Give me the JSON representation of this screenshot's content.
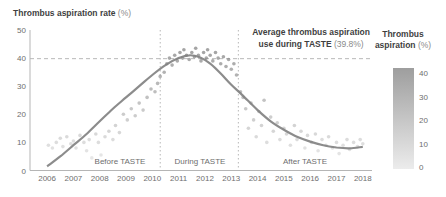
{
  "title": {
    "main": "Thrombus aspiration rate",
    "unit": " (%)"
  },
  "annotation": {
    "line1": "Average thrombus aspiration",
    "line2_bold": "use during TASTE",
    "line2_value": " (39.8%)"
  },
  "phases": {
    "before": "Before TASTE",
    "during": "During TASTE",
    "after": "After TASTE"
  },
  "legend": {
    "title_line1": "Thrombus",
    "title_line2": "aspiration",
    "unit": " (%)",
    "ticks": [
      "40",
      "30",
      "20",
      "10",
      "0"
    ]
  },
  "colors": {
    "axis": "#b5b5b5",
    "guide": "#b8b8b8",
    "tick_text": "#6e6e6e",
    "curve": "#808080",
    "dot_dark": "#7d7d7d",
    "dot_light": "#e8e8e8"
  },
  "chart_data": {
    "type": "scatter",
    "title": "Thrombus aspiration rate (%)",
    "xlabel": "Year",
    "ylabel": "Thrombus aspiration rate (%)",
    "xlim": [
      2005.35,
      2018.35
    ],
    "ylim": [
      0,
      50
    ],
    "x_ticks": [
      2006,
      2007,
      2008,
      2009,
      2010,
      2011,
      2012,
      2013,
      2014,
      2015,
      2016,
      2017,
      2018
    ],
    "y_ticks": [
      0,
      10,
      20,
      30,
      40,
      50
    ],
    "grid": false,
    "average_line": {
      "value": 39.8,
      "label": "Average thrombus aspiration use during TASTE (39.8%)"
    },
    "taste_period": {
      "start": 2010.3,
      "end": 2013.27
    },
    "colorbar": {
      "title": "Thrombus aspiration (%)",
      "min": 0,
      "max": 43,
      "ticks": [
        40,
        30,
        20,
        10,
        0
      ]
    },
    "trend": [
      [
        2006,
        1.5
      ],
      [
        2006.5,
        5
      ],
      [
        2007,
        9
      ],
      [
        2007.5,
        13
      ],
      [
        2008,
        17.5
      ],
      [
        2008.5,
        22
      ],
      [
        2009,
        26
      ],
      [
        2009.5,
        30
      ],
      [
        2010,
        34
      ],
      [
        2010.5,
        37.5
      ],
      [
        2011,
        40
      ],
      [
        2011.4,
        41
      ],
      [
        2011.8,
        40.3
      ],
      [
        2012.2,
        38
      ],
      [
        2012.6,
        34.5
      ],
      [
        2013,
        30.5
      ],
      [
        2013.4,
        27
      ],
      [
        2014,
        21.5
      ],
      [
        2014.5,
        17.5
      ],
      [
        2015,
        14.5
      ],
      [
        2015.5,
        12
      ],
      [
        2016,
        10.3
      ],
      [
        2016.5,
        9
      ],
      [
        2017,
        8.2
      ],
      [
        2017.5,
        7.9
      ],
      [
        2018,
        8.4
      ]
    ],
    "scatter": [
      [
        2006.05,
        9
      ],
      [
        2006.2,
        8
      ],
      [
        2006.35,
        10
      ],
      [
        2006.5,
        11.5
      ],
      [
        2006.6,
        8.5
      ],
      [
        2006.75,
        12
      ],
      [
        2006.9,
        9.5
      ],
      [
        2007.0,
        10.5
      ],
      [
        2007.1,
        8
      ],
      [
        2007.25,
        12.5
      ],
      [
        2007.4,
        10
      ],
      [
        2007.5,
        7
      ],
      [
        2007.6,
        11
      ],
      [
        2007.7,
        4.5
      ],
      [
        2007.85,
        13
      ],
      [
        2007.95,
        10
      ],
      [
        2008.05,
        5.5
      ],
      [
        2008.2,
        12
      ],
      [
        2008.35,
        14
      ],
      [
        2008.5,
        11
      ],
      [
        2008.6,
        16
      ],
      [
        2008.75,
        13.5
      ],
      [
        2008.9,
        20
      ],
      [
        2009.05,
        18
      ],
      [
        2009.2,
        22
      ],
      [
        2009.35,
        19.5
      ],
      [
        2009.5,
        24
      ],
      [
        2009.65,
        21.5
      ],
      [
        2009.8,
        26
      ],
      [
        2009.95,
        29
      ],
      [
        2010.1,
        28
      ],
      [
        2010.2,
        31
      ],
      [
        2010.3,
        33.5
      ],
      [
        2010.45,
        35
      ],
      [
        2010.55,
        38
      ],
      [
        2010.65,
        40
      ],
      [
        2010.75,
        37.5
      ],
      [
        2010.85,
        41
      ],
      [
        2010.95,
        39
      ],
      [
        2011.05,
        42
      ],
      [
        2011.15,
        40
      ],
      [
        2011.2,
        43
      ],
      [
        2011.3,
        41
      ],
      [
        2011.4,
        39.5
      ],
      [
        2011.5,
        42
      ],
      [
        2011.6,
        40.5
      ],
      [
        2011.65,
        43.5
      ],
      [
        2011.75,
        41
      ],
      [
        2011.85,
        39
      ],
      [
        2011.95,
        42
      ],
      [
        2012.05,
        40
      ],
      [
        2012.1,
        43
      ],
      [
        2012.2,
        41
      ],
      [
        2012.3,
        39
      ],
      [
        2012.4,
        42
      ],
      [
        2012.5,
        40
      ],
      [
        2012.6,
        38
      ],
      [
        2012.7,
        40.5
      ],
      [
        2012.8,
        37
      ],
      [
        2012.9,
        39.5
      ],
      [
        2013.0,
        36
      ],
      [
        2013.1,
        38
      ],
      [
        2013.2,
        34
      ],
      [
        2013.35,
        28
      ],
      [
        2013.45,
        26
      ],
      [
        2013.55,
        22
      ],
      [
        2013.65,
        15
      ],
      [
        2013.75,
        24
      ],
      [
        2013.85,
        18
      ],
      [
        2013.95,
        12
      ],
      [
        2014.05,
        21
      ],
      [
        2014.15,
        16
      ],
      [
        2014.25,
        25
      ],
      [
        2014.35,
        10
      ],
      [
        2014.5,
        19
      ],
      [
        2014.6,
        14
      ],
      [
        2014.75,
        17
      ],
      [
        2014.85,
        11
      ],
      [
        2015.0,
        15
      ],
      [
        2015.1,
        13
      ],
      [
        2015.25,
        9
      ],
      [
        2015.4,
        16
      ],
      [
        2015.5,
        11
      ],
      [
        2015.65,
        14
      ],
      [
        2015.8,
        8
      ],
      [
        2015.9,
        12.5
      ],
      [
        2016.05,
        10
      ],
      [
        2016.2,
        13
      ],
      [
        2016.3,
        7
      ],
      [
        2016.45,
        11
      ],
      [
        2016.6,
        9
      ],
      [
        2016.7,
        12
      ],
      [
        2016.85,
        8
      ],
      [
        2017.0,
        10
      ],
      [
        2017.1,
        6
      ],
      [
        2017.25,
        9
      ],
      [
        2017.4,
        11
      ],
      [
        2017.5,
        7.5
      ],
      [
        2017.65,
        10
      ],
      [
        2017.8,
        8.5
      ],
      [
        2017.9,
        11
      ],
      [
        2018.0,
        9.5
      ]
    ],
    "layout": {
      "left": 30,
      "right": 372,
      "top": 30,
      "bottom": 170.5,
      "tick_label_y": 181,
      "avg_line_right": 370
    }
  }
}
